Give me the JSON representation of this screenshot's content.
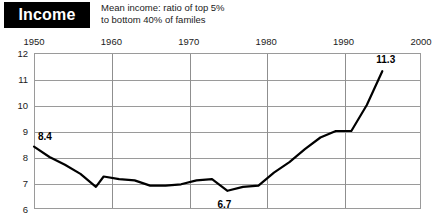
{
  "header": {
    "category_label": "Income",
    "subtitle_line1": "Mean income: ratio of top 5%",
    "subtitle_line2": "to bottom 40% of familes"
  },
  "chart_data": {
    "type": "line",
    "title": "Income",
    "subtitle": "Mean income: ratio of top 5% to bottom 40% of familes",
    "xlabel": "",
    "ylabel": "",
    "xlim": [
      1950,
      2000
    ],
    "ylim": [
      6,
      12
    ],
    "grid": true,
    "legend": false,
    "xticks": [
      "1950",
      "1960",
      "1970",
      "1980",
      "1990",
      "2000"
    ],
    "xtick_values": [
      1950,
      1960,
      1970,
      1980,
      1990,
      2000
    ],
    "yticks": [
      "6",
      "7",
      "8",
      "9",
      "10",
      "11",
      "12"
    ],
    "ytick_values": [
      6,
      7,
      8,
      9,
      10,
      11,
      12
    ],
    "x": [
      1950,
      1952,
      1954,
      1956,
      1958,
      1959,
      1961,
      1963,
      1965,
      1967,
      1969,
      1971,
      1973,
      1975,
      1977,
      1979,
      1981,
      1983,
      1985,
      1987,
      1989,
      1991,
      1993,
      1995
    ],
    "values": [
      8.4,
      8.0,
      7.7,
      7.35,
      6.85,
      7.25,
      7.15,
      7.1,
      6.9,
      6.9,
      6.95,
      7.1,
      7.15,
      6.7,
      6.85,
      6.9,
      7.4,
      7.8,
      8.3,
      8.75,
      9.0,
      9.0,
      10.0,
      11.3
    ],
    "annotations": [
      {
        "label": "8.4",
        "x": 1950,
        "y": 8.4
      },
      {
        "label": "6.7",
        "x": 1975,
        "y": 6.7
      },
      {
        "label": "11.3",
        "x": 1995,
        "y": 11.3
      }
    ],
    "series_color": "#000000",
    "grid_color": "#9a9a9a"
  }
}
